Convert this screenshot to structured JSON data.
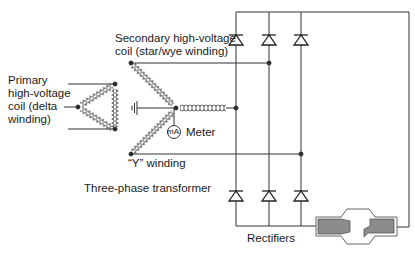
{
  "diagram": {
    "labels": {
      "primary": [
        "Primary",
        "high-voltage",
        "coil (delta",
        "winding)"
      ],
      "secondary": [
        "Secondary high-voltage",
        "coil (star/wye winding)"
      ],
      "meter": "Meter",
      "meter_symbol": "mA",
      "y_winding": "“Y” winding",
      "transformer": "Three-phase transformer",
      "rectifiers": "Rectifiers"
    },
    "components": {
      "primary_coil": "delta-winding-coil",
      "secondary_coil": "wye-winding-coil",
      "ground": "ground-icon",
      "meter": "milliammeter-icon",
      "rectifier_count": 6,
      "tube": "x-ray-tube-icon"
    },
    "colors": {
      "line": "#333333",
      "tube_fill": "#8c8c8c",
      "tube_outline": "#555555",
      "background": "#ffffff"
    }
  }
}
